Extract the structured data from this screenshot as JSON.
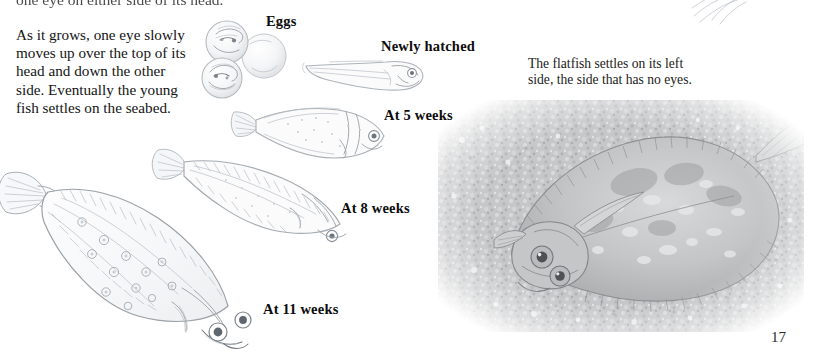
{
  "page": {
    "folio": "17",
    "background_color": "#ffffff",
    "ink_color": "#141414"
  },
  "text": {
    "clipped_top_line": "one eye on either side of its head.",
    "left_paragraph": "As it grows, one eye slowly moves up over the top of its head and down the other side. Eventually the young fish settles on the seabed.",
    "right_caption": "The flatfish settles on its left side, the side that has no eyes."
  },
  "stage_labels": [
    {
      "id": "eggs",
      "label": "Eggs"
    },
    {
      "id": "newly-hatched",
      "label": "Newly hatched"
    },
    {
      "id": "week-5",
      "label": "At 5 weeks"
    },
    {
      "id": "week-8",
      "label": "At 8 weeks"
    },
    {
      "id": "week-11",
      "label": "At 11 weeks"
    }
  ],
  "illustrations": [
    {
      "id": "eggs",
      "description": "three translucent fish eggs with embryos",
      "medium": "pencil drawing"
    },
    {
      "id": "larva",
      "description": "newly hatched larva with large eye and tapering tail",
      "medium": "pencil drawing"
    },
    {
      "id": "juvenile-5-weeks",
      "description": "young fish, symmetrical body, eye on the side",
      "medium": "pencil drawing"
    },
    {
      "id": "juvenile-8-weeks",
      "description": "flattening fish, deeper body",
      "medium": "pencil drawing"
    },
    {
      "id": "juvenile-11-weeks",
      "description": "young plaice with spots and both eyes on one side",
      "medium": "pencil drawing"
    }
  ],
  "photo": {
    "id": "adult-flatfish-on-seabed",
    "description": "adult flatfish resting camouflaged on a gravel seabed",
    "tone": "grayscale",
    "edge": "feathered vignette"
  }
}
